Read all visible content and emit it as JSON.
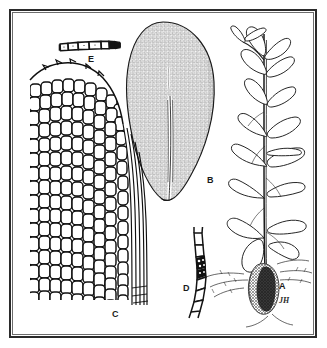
{
  "plate": {
    "type": "scientific-botanical-illustration",
    "subject": "moss (bryophyte) plate",
    "background_color": "#ffffff",
    "ink_color": "#1a1a1a",
    "frame": {
      "outer_color": "#2b2b2b",
      "inner_color": "#6d6d6d"
    }
  },
  "figures": [
    {
      "key": "A",
      "label": "A",
      "name": "habit-sketch",
      "description": "Whole plant habit: erect stem with rounded concave leaves and basal rhizoid tuft",
      "position": "right"
    },
    {
      "key": "B",
      "label": "B",
      "name": "leaf-whole",
      "description": "Single ovate leaf showing areolation and central costa",
      "position": "top-center"
    },
    {
      "key": "C",
      "label": "C",
      "name": "leaf-cells-detail",
      "description": "Enlarged leaf apex and margin showing cell pattern",
      "position": "left"
    },
    {
      "key": "D",
      "label": "D",
      "name": "filament-detail",
      "description": "Curved filament of elongate cells with dark papillae",
      "position": "bottom-center"
    },
    {
      "key": "E",
      "label": "E",
      "name": "cell-chain-detail",
      "description": "Horizontal chain of rectangular cells",
      "position": "top-left"
    }
  ],
  "signature": {
    "text": "JH",
    "name": "artist-monogram"
  }
}
